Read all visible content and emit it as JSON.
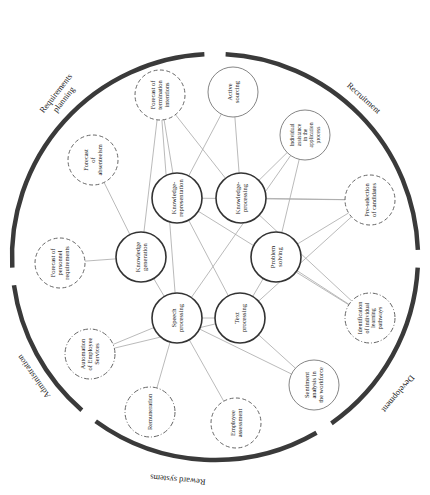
{
  "diagram": {
    "type": "circular-network",
    "ring": {
      "center": [
        215,
        257
      ],
      "radius": 203,
      "stroke": "#3a3a3a",
      "segments": [
        {
          "id": "recruitment",
          "label": "Recruitment",
          "start_deg": -87,
          "end_deg": -2
        },
        {
          "id": "development",
          "label": "Development",
          "start_deg": 3,
          "end_deg": 55
        },
        {
          "id": "reward",
          "label": "Reward systems",
          "start_deg": 60,
          "end_deg": 126
        },
        {
          "id": "administration",
          "label": "Administration",
          "start_deg": 131,
          "end_deg": 172
        },
        {
          "id": "requirements",
          "label": "Requirements planning",
          "start_deg": 177,
          "end_deg": 267
        }
      ],
      "labels": [
        {
          "segment": "requirements",
          "lines": [
            "Requirements",
            "planning"
          ],
          "x": 58,
          "y": 95,
          "rotate": -52
        },
        {
          "segment": "recruitment",
          "lines": [
            "Recruitment"
          ],
          "x": 362,
          "y": 100,
          "rotate": 42
        },
        {
          "segment": "development",
          "lines": [
            "Development"
          ],
          "x": 396,
          "y": 392,
          "rotate": -50,
          "flip": true
        },
        {
          "segment": "reward",
          "lines": [
            "Reward systems"
          ],
          "x": 178,
          "y": 477,
          "rotate": 5,
          "flip": true
        },
        {
          "segment": "administration",
          "lines": [
            "Administration"
          ],
          "x": 36,
          "y": 375,
          "rotate": 55,
          "flip": true
        }
      ]
    },
    "core_nodes": [
      {
        "id": "kr",
        "lines": [
          "Knowledge-",
          "representation"
        ],
        "cx": 177,
        "cy": 198
      },
      {
        "id": "kp",
        "lines": [
          "Knowledge-",
          "processing"
        ],
        "cx": 241,
        "cy": 198
      },
      {
        "id": "kg",
        "lines": [
          "Knowledge",
          "generation"
        ],
        "cx": 141,
        "cy": 257
      },
      {
        "id": "ps",
        "lines": [
          "Problem",
          "solving"
        ],
        "cx": 276,
        "cy": 257
      },
      {
        "id": "sp",
        "lines": [
          "Speech",
          "processing"
        ],
        "cx": 177,
        "cy": 318
      },
      {
        "id": "tp",
        "lines": [
          "Text",
          "processing"
        ],
        "cx": 240,
        "cy": 318
      }
    ],
    "application_nodes": [
      {
        "id": "fti",
        "lines": [
          "Forecast of",
          "termination",
          "intentions"
        ],
        "cx": 160,
        "cy": 95,
        "style": "dashed"
      },
      {
        "id": "as",
        "lines": [
          "Active",
          "sourcing"
        ],
        "cx": 233,
        "cy": 92,
        "style": "solid"
      },
      {
        "id": "iaap",
        "lines": [
          "Individual",
          "assistance",
          "in the",
          "application",
          "process"
        ],
        "cx": 305,
        "cy": 135,
        "style": "solid"
      },
      {
        "id": "psc",
        "lines": [
          "Pre-selection",
          "of candidates"
        ],
        "cx": 370,
        "cy": 200,
        "style": "dashed"
      },
      {
        "id": "iilp",
        "lines": [
          "Identification",
          "of individual",
          "learning",
          "pathways"
        ],
        "cx": 370,
        "cy": 318,
        "style": "dashdot"
      },
      {
        "id": "saw",
        "lines": [
          "Sentiment",
          "analysis in",
          "the workforce"
        ],
        "cx": 314,
        "cy": 385,
        "style": "solid"
      },
      {
        "id": "ea",
        "lines": [
          "Employee",
          "assessment"
        ],
        "cx": 236,
        "cy": 423,
        "style": "dashed"
      },
      {
        "id": "rem",
        "lines": [
          "Remuneration"
        ],
        "cx": 150,
        "cy": 412,
        "style": "dashdot"
      },
      {
        "id": "aes",
        "lines": [
          "Automation",
          "of Employee",
          "Services"
        ],
        "cx": 90,
        "cy": 354,
        "style": "dashdot"
      },
      {
        "id": "fpr",
        "lines": [
          "Forecast of",
          "personnel",
          "requirements"
        ],
        "cx": 60,
        "cy": 263,
        "style": "dashed"
      },
      {
        "id": "fa",
        "lines": [
          "Forecast",
          "of",
          "absenteeism"
        ],
        "cx": 93,
        "cy": 160,
        "style": "dashed"
      }
    ],
    "edges": [
      [
        "fti",
        "kg"
      ],
      [
        "fti",
        "kr"
      ],
      [
        "fti",
        "sp"
      ],
      [
        "fti",
        "kp"
      ],
      [
        "as",
        "kr"
      ],
      [
        "as",
        "kp"
      ],
      [
        "iaap",
        "ps"
      ],
      [
        "iaap",
        "kp"
      ],
      [
        "iaap",
        "sp"
      ],
      [
        "psc",
        "kp"
      ],
      [
        "psc",
        "kr"
      ],
      [
        "psc",
        "ps"
      ],
      [
        "psc",
        "tp"
      ],
      [
        "iilp",
        "ps"
      ],
      [
        "iilp",
        "kp"
      ],
      [
        "iilp",
        "kr"
      ],
      [
        "saw",
        "tp"
      ],
      [
        "saw",
        "sp"
      ],
      [
        "ea",
        "sp"
      ],
      [
        "rem",
        "sp"
      ],
      [
        "aes",
        "sp"
      ],
      [
        "aes",
        "tp"
      ],
      [
        "fpr",
        "kg"
      ],
      [
        "fa",
        "kg"
      ],
      [
        "kg",
        "sp"
      ],
      [
        "kr",
        "tp"
      ],
      [
        "sp",
        "tp"
      ],
      [
        "tp",
        "ps"
      ]
    ],
    "colors": {
      "ring": "#3a3a3a",
      "core_stroke": "#333333",
      "app_stroke": "#666666",
      "edge": "#a8a8a8",
      "text": "#222222"
    }
  }
}
